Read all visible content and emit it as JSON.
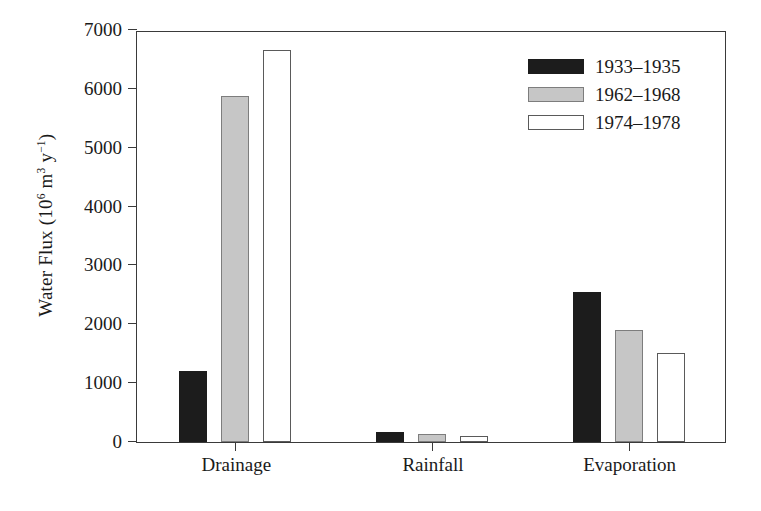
{
  "chart_data": {
    "type": "bar",
    "title": "",
    "xlabel": "",
    "ylabel": "Water Flux (10^6 m^3 y^-1)",
    "ylabel_parts": {
      "lead": "Water Flux (10",
      "exp1": "6",
      "mid": " m",
      "exp2": "3",
      "mid2": " y",
      "exp3": "−1",
      "tail": ")"
    },
    "categories": [
      "Drainage",
      "Rainfall",
      "Evaporation"
    ],
    "series": [
      {
        "name": "1933–1935",
        "color": "#1c1c1c",
        "values": [
          1200,
          170,
          2550
        ]
      },
      {
        "name": "1962–1968",
        "color": "#c6c6c6",
        "values": [
          5880,
          140,
          1900
        ]
      },
      {
        "name": "1974–1978",
        "color": "#ffffff",
        "values": [
          6660,
          100,
          1520
        ]
      }
    ],
    "ylim": [
      0,
      7000
    ],
    "yticks": [
      0,
      1000,
      2000,
      3000,
      4000,
      5000,
      6000,
      7000
    ],
    "ytick_labels": [
      "0",
      "1000",
      "2000",
      "3000",
      "4000",
      "5000",
      "6000",
      "7000"
    ],
    "grid": false,
    "legend_position": "top-right",
    "axis_color": "#3a3a3a"
  }
}
